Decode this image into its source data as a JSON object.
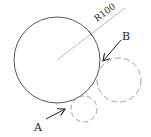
{
  "diagram": {
    "radius_label": "R100",
    "label_a": "A",
    "label_b": "B",
    "colors": {
      "main_stroke": "#444444",
      "dashed_stroke": "#999999",
      "radius_line": "#aaaaaa",
      "arrow": "#222222"
    },
    "main_circle": {
      "cx": 57,
      "cy": 60,
      "r": 43
    },
    "dashed_circle_large": {
      "cx": 119,
      "cy": 80,
      "r": 22
    },
    "dashed_circle_small": {
      "cx": 84,
      "cy": 109,
      "r": 13
    }
  }
}
